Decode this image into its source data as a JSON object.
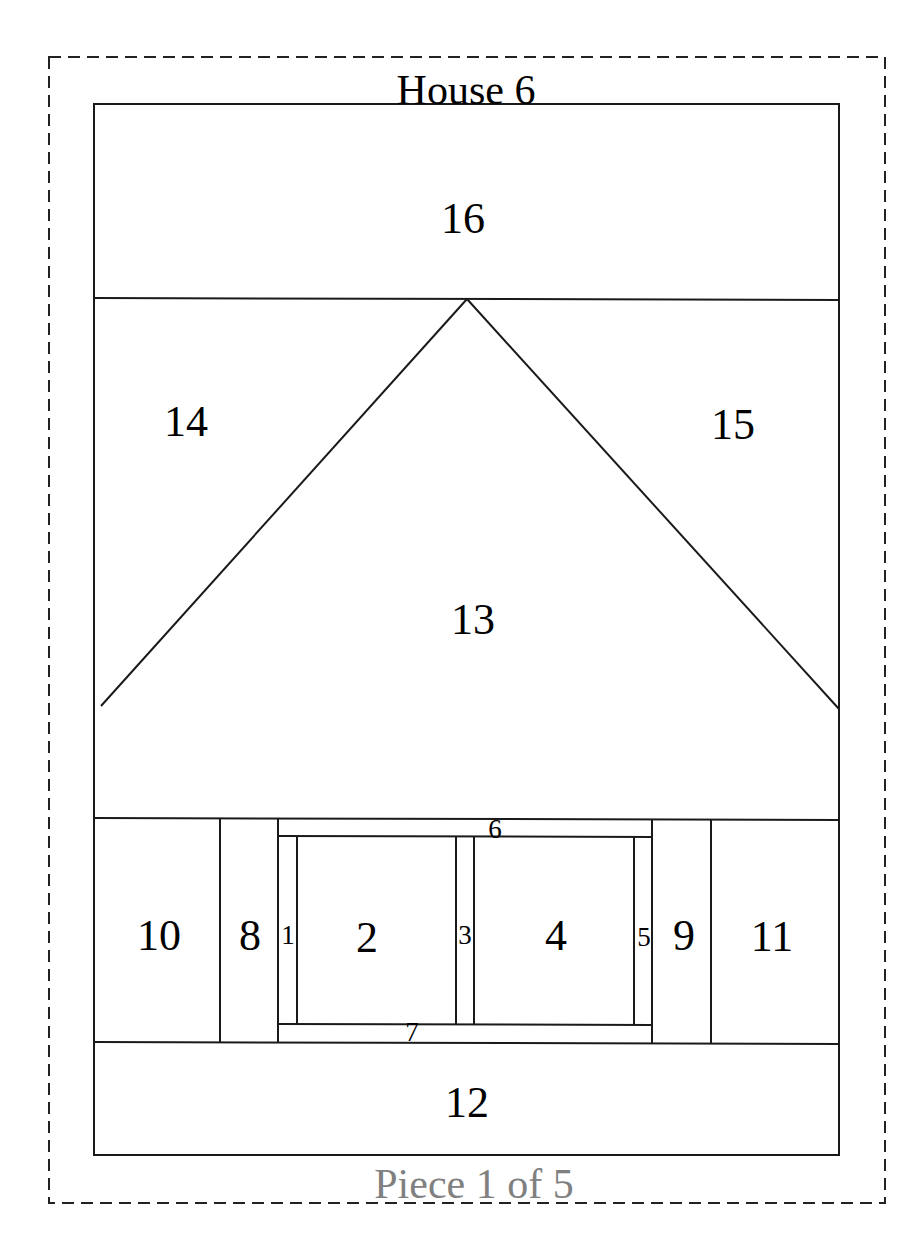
{
  "pattern": {
    "title": "House 6",
    "footer": "Piece 1 of 5",
    "footer_color": "#808080",
    "line_color": "#1a1a1a"
  },
  "pieces": {
    "p1": "1",
    "p2": "2",
    "p3": "3",
    "p4": "4",
    "p5": "5",
    "p6": "6",
    "p7": "7",
    "p8": "8",
    "p9": "9",
    "p10": "10",
    "p11": "11",
    "p12": "12",
    "p13": "13",
    "p14": "14",
    "p15": "15",
    "p16": "16"
  }
}
